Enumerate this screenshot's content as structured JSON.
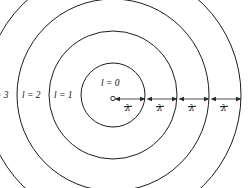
{
  "figure": {
    "type": "physics-diagram",
    "canvas": {
      "width": 249,
      "height": 188
    },
    "center": {
      "x": 113,
      "y": 95
    },
    "stroke_color": "#1c1c1c",
    "arrow_color": "#2a2a2a",
    "background_color": "#ffffff",
    "origin_marker": {
      "x": 113,
      "y": 98,
      "radius": 2.2
    },
    "shells": [
      {
        "id": "l0",
        "label": "l = 0",
        "radius": 32,
        "label_x": 101,
        "label_y": 84
      },
      {
        "id": "l1",
        "label": "l = 1",
        "radius": 64,
        "label_x": 54,
        "label_y": 91
      },
      {
        "id": "l2",
        "label": "l = 2",
        "radius": 96,
        "label_x": 22,
        "label_y": 91
      },
      {
        "id": "l3",
        "label": "l = 3",
        "radius": 128,
        "label_x": -10,
        "label_y": 91
      }
    ],
    "spacings": [
      {
        "id": "gap-0",
        "symbol": "λ",
        "from_x": 115,
        "to_x": 145,
        "label_x": 130,
        "label_y": 104
      },
      {
        "id": "gap-1",
        "symbol": "λ",
        "from_x": 147,
        "to_x": 177,
        "label_x": 162,
        "label_y": 104
      },
      {
        "id": "gap-2",
        "symbol": "λ",
        "from_x": 179,
        "to_x": 209,
        "label_x": 194,
        "label_y": 104
      },
      {
        "id": "gap-3",
        "symbol": "λ",
        "from_x": 211,
        "to_x": 241,
        "label_x": 226,
        "label_y": 104
      }
    ]
  }
}
